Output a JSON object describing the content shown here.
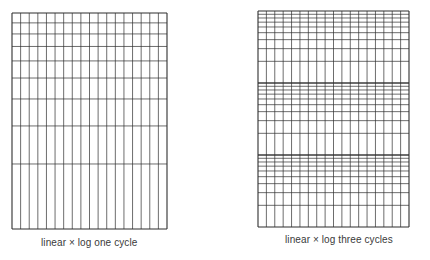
{
  "figure": {
    "background": "#ffffff",
    "line_color": "#2e2e2e",
    "panels": [
      {
        "id": "one-cycle",
        "caption": "linear × log one cycle",
        "grid": {
          "x": 12,
          "y": 13,
          "width": 155,
          "height": 216,
          "linear_columns": 18,
          "log_cycles": 1,
          "orientation": "decades increase upward"
        },
        "caption_pos": {
          "left": 41,
          "top": 237
        }
      },
      {
        "id": "three-cycles",
        "caption": "linear × log three cycles",
        "grid": {
          "x": 258,
          "y": 11,
          "width": 151,
          "height": 216,
          "linear_columns": 18,
          "log_cycles": 3,
          "orientation": "decades increase upward"
        },
        "caption_pos": {
          "left": 285,
          "top": 234
        }
      }
    ]
  }
}
